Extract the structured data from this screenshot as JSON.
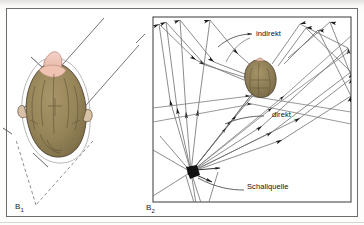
{
  "figure": {
    "language": "de",
    "background_color": "#fdfdfc",
    "frame_color": "#6e6e6e",
    "ink_color": "#333333",
    "panels": [
      {
        "id": "B1",
        "caption": "B",
        "caption_sub": "1",
        "description": "Kopf von oben mit Schalleinfallsrichtungen",
        "subject": "head-from-above",
        "colors": {
          "hair": "#9a8a60",
          "hair_shadow": "#7d6d48",
          "skin": "#e9bfae",
          "outline": "#4a4036"
        }
      },
      {
        "id": "B2",
        "caption": "B",
        "caption_sub": "2",
        "description": "Raum mit Schallquelle, direkte und indirekte Schallwege",
        "labels": [
          {
            "name": "indirekt",
            "text": "indirekt"
          },
          {
            "name": "direkt",
            "text": "direkt"
          },
          {
            "name": "schallquelle",
            "text": "Schallquelle"
          }
        ],
        "source_marker_color": "#121212"
      }
    ]
  }
}
